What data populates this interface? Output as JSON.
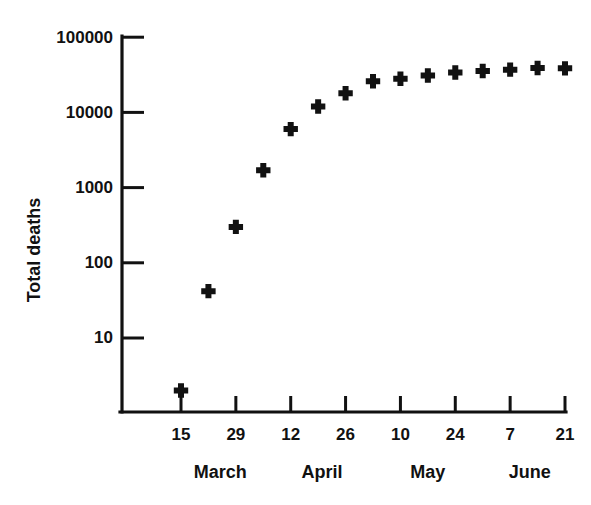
{
  "chart_data": {
    "type": "scatter",
    "title": "",
    "subtitle": "",
    "xlabel": "",
    "ylabel": "Total deaths",
    "yscale": "log",
    "ylim": [
      1,
      100000
    ],
    "grid": false,
    "legend": null,
    "marker_style": "plus",
    "marker_color": "#111111",
    "y_ticks": [
      {
        "value": 10,
        "label": "10"
      },
      {
        "value": 100,
        "label": "100"
      },
      {
        "value": 1000,
        "label": "1000"
      },
      {
        "value": 10000,
        "label": "10000"
      },
      {
        "value": 100000,
        "label": "100000"
      }
    ],
    "x_ticks": [
      {
        "label": "15",
        "day_index": 0
      },
      {
        "label": "29",
        "day_index": 14
      },
      {
        "label": "12",
        "day_index": 28
      },
      {
        "label": "26",
        "day_index": 42
      },
      {
        "label": "10",
        "day_index": 56
      },
      {
        "label": "24",
        "day_index": 70
      },
      {
        "label": "7",
        "day_index": 84
      },
      {
        "label": "21",
        "day_index": 98
      }
    ],
    "month_labels": [
      {
        "label": "March",
        "day_index": 10
      },
      {
        "label": "April",
        "day_index": 36
      },
      {
        "label": "May",
        "day_index": 63
      },
      {
        "label": "June",
        "day_index": 89
      }
    ],
    "series": [
      {
        "name": "Total deaths",
        "points": [
          {
            "x_label": "15 March",
            "day_index": 0,
            "y": 2
          },
          {
            "x_label": "22 March",
            "day_index": 7,
            "y": 42
          },
          {
            "x_label": "29 March",
            "day_index": 14,
            "y": 300
          },
          {
            "x_label": "5 April",
            "day_index": 21,
            "y": 1700
          },
          {
            "x_label": "12 April",
            "day_index": 28,
            "y": 6000
          },
          {
            "x_label": "19 April",
            "day_index": 35,
            "y": 12000
          },
          {
            "x_label": "26 April",
            "day_index": 42,
            "y": 18000
          },
          {
            "x_label": "3 May",
            "day_index": 49,
            "y": 26000
          },
          {
            "x_label": "10 May",
            "day_index": 56,
            "y": 28000
          },
          {
            "x_label": "17 May",
            "day_index": 63,
            "y": 31000
          },
          {
            "x_label": "24 May",
            "day_index": 70,
            "y": 34000
          },
          {
            "x_label": "31 May",
            "day_index": 77,
            "y": 35500
          },
          {
            "x_label": "7 June",
            "day_index": 84,
            "y": 37000
          },
          {
            "x_label": "14 June",
            "day_index": 91,
            "y": 39000
          },
          {
            "x_label": "21 June",
            "day_index": 98,
            "y": 38500
          }
        ]
      }
    ]
  },
  "figure": {
    "background_color": "#ffffff",
    "axis_color": "#111111"
  }
}
